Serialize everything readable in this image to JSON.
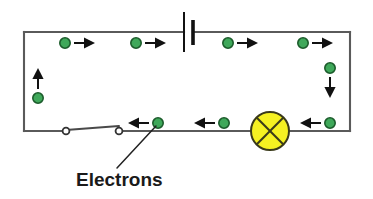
{
  "figure": {
    "background_color": "#ffffff",
    "width": 373,
    "height": 199
  },
  "caption": {
    "label": "Electrons",
    "x": 76,
    "y": 186,
    "font_size": 19,
    "color": "#1a1a1a"
  },
  "colors": {
    "wire": "#5a5a5a",
    "electron_fill": "#3fa85a",
    "electron_outline": "#1c5c2c",
    "arrow": "#111111",
    "lamp_fill": "#f5f122",
    "lamp_outline": "#3a3a1a",
    "battery": "#111111",
    "switch_terminal_fill": "#ffffff",
    "leader": "#222222"
  },
  "circuit": {
    "frame": {
      "left": 24,
      "right": 350,
      "top": 32,
      "bottom": 131
    },
    "wire_segments": [
      {
        "name": "top-wire-left",
        "x1": 24,
        "y1": 32,
        "x2": 184,
        "y2": 32
      },
      {
        "name": "top-wire-right",
        "x1": 193,
        "y1": 32,
        "x2": 350,
        "y2": 32
      },
      {
        "name": "left-wire",
        "x1": 24,
        "y1": 32,
        "x2": 24,
        "y2": 131
      },
      {
        "name": "right-wire",
        "x1": 350,
        "y1": 32,
        "x2": 350,
        "y2": 131
      },
      {
        "name": "bottom-wire-left",
        "x1": 24,
        "y1": 131,
        "x2": 62,
        "y2": 131
      },
      {
        "name": "bottom-wire-middle",
        "x1": 116,
        "y1": 131,
        "x2": 252,
        "y2": 131
      },
      {
        "name": "bottom-wire-right",
        "x1": 289,
        "y1": 131,
        "x2": 350,
        "y2": 131
      }
    ]
  },
  "components": {
    "battery": {
      "name": "battery",
      "long_plate": {
        "x": 184,
        "y1": 12,
        "y2": 52
      },
      "short_plate": {
        "x": 193,
        "y1": 20,
        "y2": 45
      }
    },
    "lamp": {
      "name": "lamp",
      "cx": 270,
      "cy": 131,
      "r": 19,
      "symbol": "circle-with-cross"
    },
    "switch": {
      "name": "switch",
      "terminal_left": {
        "cx": 66,
        "cy": 131,
        "r": 3.4
      },
      "terminal_right": {
        "cx": 119,
        "cy": 131,
        "r": 3.4
      },
      "blade": {
        "x1": 66,
        "y1": 130,
        "x2": 119,
        "y2": 126
      },
      "state": "open"
    }
  },
  "electrons": [
    {
      "id": "e-top-1",
      "cx": 65,
      "cy": 43,
      "r": 5.2,
      "direction": "right",
      "arrow": {
        "x1": 74,
        "y1": 43,
        "x2": 95,
        "y2": 43
      }
    },
    {
      "id": "e-top-2",
      "cx": 136,
      "cy": 43,
      "r": 5.2,
      "direction": "right",
      "arrow": {
        "x1": 145,
        "y1": 43,
        "x2": 166,
        "y2": 43
      }
    },
    {
      "id": "e-top-3",
      "cx": 228,
      "cy": 43,
      "r": 5.2,
      "direction": "right",
      "arrow": {
        "x1": 237,
        "y1": 43,
        "x2": 258,
        "y2": 43
      }
    },
    {
      "id": "e-top-4",
      "cx": 303,
      "cy": 43,
      "r": 5.2,
      "direction": "right",
      "arrow": {
        "x1": 312,
        "y1": 43,
        "x2": 333,
        "y2": 43
      }
    },
    {
      "id": "e-left-1",
      "cx": 38,
      "cy": 98,
      "r": 5.2,
      "direction": "up",
      "arrow": {
        "x1": 38,
        "y1": 89,
        "x2": 38,
        "y2": 68
      }
    },
    {
      "id": "e-right-1",
      "cx": 330,
      "cy": 68,
      "r": 5.2,
      "direction": "down",
      "arrow": {
        "x1": 330,
        "y1": 77,
        "x2": 330,
        "y2": 98
      }
    },
    {
      "id": "e-bottom-1",
      "cx": 158,
      "cy": 123,
      "r": 5.2,
      "direction": "left",
      "arrow": {
        "x1": 149,
        "y1": 123,
        "x2": 128,
        "y2": 123
      }
    },
    {
      "id": "e-bottom-2",
      "cx": 224,
      "cy": 123,
      "r": 5.2,
      "direction": "left",
      "arrow": {
        "x1": 215,
        "y1": 123,
        "x2": 194,
        "y2": 123
      }
    },
    {
      "id": "e-bottom-3",
      "cx": 330,
      "cy": 123,
      "r": 5.2,
      "direction": "left",
      "arrow": {
        "x1": 321,
        "y1": 123,
        "x2": 300,
        "y2": 123
      }
    }
  ],
  "leader": {
    "name": "leader-line",
    "x1": 117,
    "y1": 168,
    "x2": 156,
    "y2": 126
  }
}
